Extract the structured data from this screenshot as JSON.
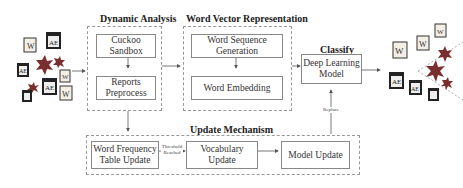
{
  "diagram": {
    "groups": {
      "dynamic_analysis": {
        "title": "Dynamic Analysis",
        "boxes": [
          "Cuckoo Sandbox",
          "Reports Preprocess"
        ]
      },
      "word_vector": {
        "title": "Word Vector Representation",
        "boxes": [
          "Word Sequence Generation",
          "Word Embedding"
        ]
      },
      "classify": {
        "title": "Classify",
        "box": "Deep Learning Model"
      },
      "update": {
        "title": "Update Mechanism",
        "boxes": [
          "Word Frequency Table Update",
          "Vocabulary Update",
          "Model Update"
        ]
      }
    },
    "edge_labels": {
      "threshold": "Threshold Reached",
      "replace": "Replace"
    },
    "input_icons": [
      "word-doc",
      "pdf-doc",
      "malware",
      "malware",
      "pdf-doc",
      "word-doc",
      "malware",
      "pdf-doc",
      "word-doc",
      "malware"
    ],
    "output_icons": {
      "benign": [
        "word-doc",
        "word-doc",
        "word-doc",
        "pdf-doc",
        "pdf-doc",
        "pdf-doc"
      ],
      "malicious": [
        "malware",
        "malware",
        "malware"
      ]
    },
    "colors": {
      "box_border": "#888888",
      "dashed_border": "#999999",
      "arrow": "#555555",
      "malware": "#8b3a3a"
    }
  }
}
